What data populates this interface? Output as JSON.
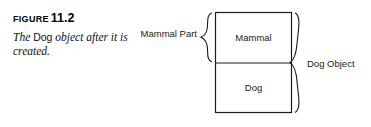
{
  "figure": {
    "label_word": "Figure",
    "number": "11.2",
    "caption_part1": "The ",
    "caption_code": "Dog",
    "caption_part2": " object after it is created."
  },
  "diagram": {
    "type": "object-layout-diagram",
    "boxes": [
      {
        "id": "mammal-box",
        "label": "Mammal"
      },
      {
        "id": "dog-box",
        "label": "Dog"
      }
    ],
    "braces": [
      {
        "id": "mammal-part-brace",
        "label": "Mammal Part",
        "side": "left",
        "spans": [
          "Mammal"
        ]
      },
      {
        "id": "dog-object-brace",
        "label": "Dog Object",
        "side": "right",
        "spans": [
          "Mammal",
          "Dog"
        ]
      }
    ],
    "colors": {
      "stroke": "#1b1b1b",
      "fill": "#ffffff",
      "text": "#1a1a1a"
    }
  }
}
